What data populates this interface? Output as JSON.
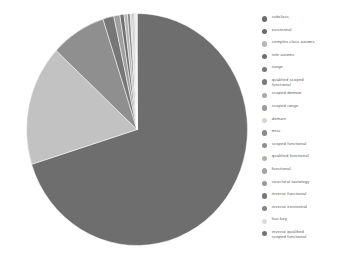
{
  "chart_data": {
    "type": "pie",
    "title": "",
    "subtitle": "",
    "xlabel": "",
    "ylabel": "",
    "legend_position": "right",
    "grid": false,
    "categories": [
      "subclass",
      "existential",
      "complex class axioms",
      "role axioms",
      "range",
      "qualified scoped functional",
      "scoped domain",
      "scoped range",
      "domain",
      "misc",
      "scoped functional",
      "qualified functional",
      "functional",
      "structural tautology",
      "inverse functional",
      "inverse existential",
      "has key",
      "inverse qualified scoped functional"
    ],
    "values": [
      70.2,
      16.8,
      8.1,
      1.6,
      0.9,
      0.6,
      0.5,
      0.4,
      0.28,
      0.18,
      0.14,
      0.1,
      0.08,
      0.06,
      0.05,
      0.04,
      0.03,
      0.02
    ],
    "colors": [
      "#6e6e6e",
      "#c2c2c2",
      "#8f8f8f",
      "#777777",
      "#a0a0a0",
      "#707070",
      "#b5b5b5",
      "#888888",
      "#d2d2d2",
      "#959595",
      "#7c7c7c",
      "#ababab",
      "#9a9a9a",
      "#868686",
      "#717171",
      "#bdbdbd",
      "#e0e0e0",
      "#7f7f7f"
    ],
    "start_angle_deg": 0,
    "direction": "clockwise"
  },
  "legend": {
    "items": [
      {
        "label": "subclass",
        "color": "#6e6e6e"
      },
      {
        "label": "existential",
        "color": "#6b6b6b"
      },
      {
        "label": "complex class axioms",
        "color": "#b8b8b8"
      },
      {
        "label": "role axioms",
        "color": "#707070"
      },
      {
        "label": "range",
        "color": "#767676"
      },
      {
        "label": "qualified scoped\nfunctional",
        "color": "#7a7a7a"
      },
      {
        "label": "scoped  domain",
        "color": "#a8a8a8"
      },
      {
        "label": "scoped  range",
        "color": "#9c9c9c"
      },
      {
        "label": "domain",
        "color": "#d4d4d4"
      },
      {
        "label": "misc",
        "color": "#8a8a8a"
      },
      {
        "label": "scoped functional",
        "color": "#8e8e8e"
      },
      {
        "label": "qualified functional",
        "color": "#b0b0b0"
      },
      {
        "label": "functional",
        "color": "#a4a4a4"
      },
      {
        "label": "structural tautology",
        "color": "#999999"
      },
      {
        "label": "inverse functional",
        "color": "#787878"
      },
      {
        "label": "inverse existential",
        "color": "#858585"
      },
      {
        "label": "has key",
        "color": "#dcdcdc"
      },
      {
        "label": "inverse qualified\nscoped functional",
        "color": "#737373"
      }
    ]
  },
  "canvas": {
    "background": "#ffffff"
  }
}
